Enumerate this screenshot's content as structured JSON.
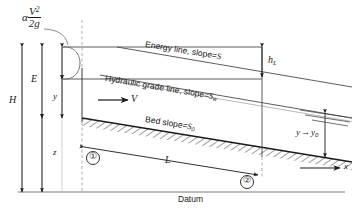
{
  "figure": {
    "type": "open-channel-flow-energy-diagram",
    "labels": {
      "velocity_head_alpha": "α",
      "velocity_head_num": "V",
      "velocity_head_num_exp": "2",
      "velocity_head_den": "2g",
      "energy_line": "Energy line, slope",
      "energy_line_eq": "=",
      "energy_line_slope": "S",
      "head_loss": "h",
      "head_loss_sub": "L",
      "hydraulic_grade_line": "Hydraulic grade line, slope",
      "hgl_eq": "=",
      "hgl_slope": "S",
      "hgl_slope_sub": "w",
      "bed_slope": "Bed slope",
      "bed_slope_eq": "=",
      "bed_slope_symbol": "S",
      "bed_slope_sub": "0",
      "specific_energy": "E",
      "depth": "y",
      "total_head": "H",
      "elevation": "z",
      "velocity": "V",
      "length": "L",
      "station_1": "①",
      "station_2": "②",
      "normal_depth_y": "y",
      "normal_depth_arrow": "→",
      "normal_depth_y0": "y",
      "normal_depth_y0_sub": "0",
      "datum": "Datum",
      "x_axis": "x"
    },
    "colors": {
      "line": "#1a1a1a",
      "thin_line": "#4a4a4a",
      "dashed": "#8a8a8a",
      "background": "#ffffff",
      "hatch": "#1a1a1a"
    }
  }
}
